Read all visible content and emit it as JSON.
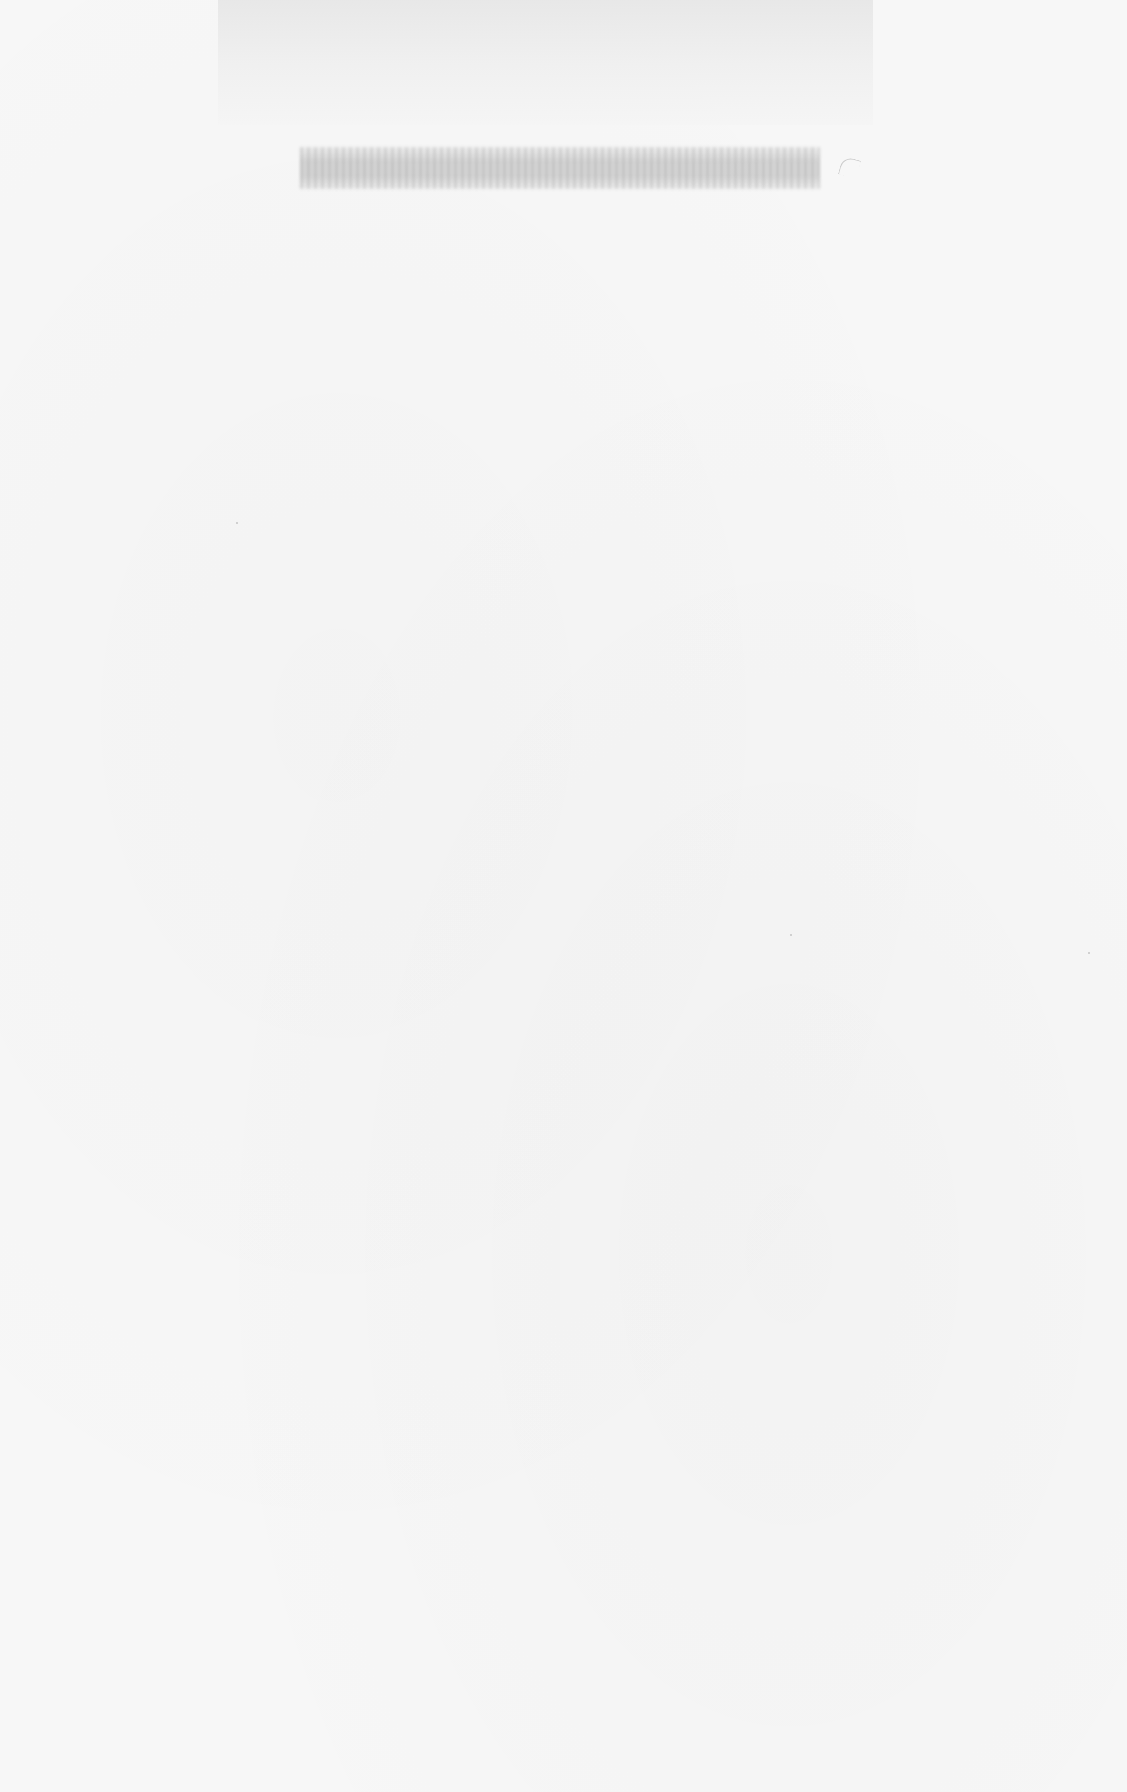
{
  "document": {
    "type": "scanned-page",
    "background_color": "#f7f7f7",
    "header_band_color": "#e8e8e8",
    "lines": [
      {
        "id": "line-1",
        "legible": false,
        "text": null
      }
    ]
  }
}
